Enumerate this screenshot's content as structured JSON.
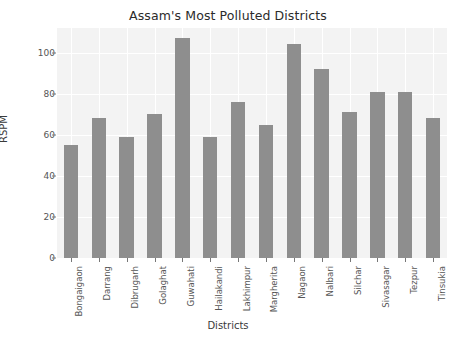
{
  "chart_data": {
    "type": "bar",
    "title": "Assam's Most Polluted Districts",
    "xlabel": "Districts",
    "ylabel": "RSPM",
    "categories": [
      "Bongaigaon",
      "Darrang",
      "Dibrugarh",
      "Golaghat",
      "Guwahati",
      "Hailakandi",
      "Lakhimpur",
      "Margherita",
      "Nagaon",
      "Nalbari",
      "Silchar",
      "Sivasagar",
      "Tezpur",
      "Tinsukia"
    ],
    "values": [
      55,
      68,
      59,
      70,
      107,
      59,
      76,
      65,
      104,
      92,
      71,
      81,
      81,
      68
    ],
    "ylim": [
      0,
      112
    ],
    "yticks": [
      0,
      20,
      40,
      60,
      80,
      100
    ],
    "ytick_labels": [
      "0",
      "20",
      "40",
      "60",
      "80",
      "100"
    ],
    "grid": true,
    "legend": null,
    "bar_color": "#8e8e8e",
    "plot_background": "#f3f3f3",
    "grid_color": "#ffffff"
  }
}
